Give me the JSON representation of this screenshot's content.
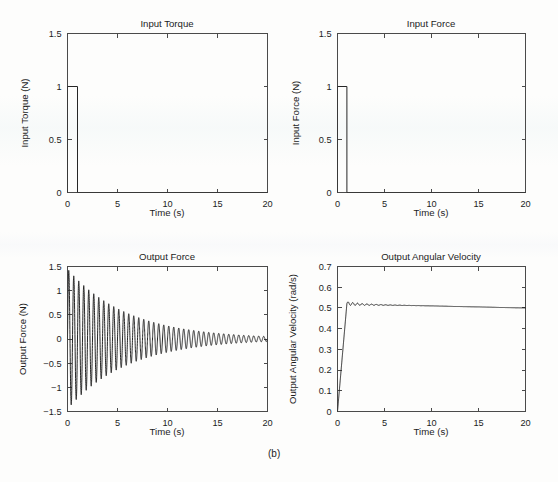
{
  "figure": {
    "subfigure_label": "(b)",
    "background_color": "#fdfdfc",
    "line_color": "#262626",
    "axis_color": "#4a4a4a"
  },
  "chart_data": [
    {
      "id": "input-torque",
      "type": "line",
      "title": "Input Torque",
      "xlabel": "Time (s)",
      "ylabel": "Input Torque (N)",
      "xlim": [
        0,
        20
      ],
      "ylim": [
        0,
        1.5
      ],
      "xticks": [
        0,
        5,
        10,
        15,
        20
      ],
      "xticklabels": [
        "0",
        "5",
        "10",
        "15",
        "20"
      ],
      "yticks": [
        0,
        0.5,
        1,
        1.5
      ],
      "yticklabels": [
        "0",
        "0.5",
        "1",
        "1.5"
      ],
      "grid": false,
      "legend": null,
      "series": [
        {
          "name": "Input Torque",
          "description": "Rectangular pulse of amplitude 1 N from t=0 s to t=1 s, zero afterwards",
          "x": [
            0,
            0,
            1,
            1,
            20
          ],
          "y": [
            0,
            1,
            1,
            0,
            0
          ]
        }
      ]
    },
    {
      "id": "input-force",
      "type": "line",
      "title": "Input Force",
      "xlabel": "Time (s)",
      "ylabel": "Input Force (N)",
      "xlim": [
        0,
        20
      ],
      "ylim": [
        0,
        1.5
      ],
      "xticks": [
        0,
        5,
        10,
        15,
        20
      ],
      "xticklabels": [
        "0",
        "5",
        "10",
        "15",
        "20"
      ],
      "yticks": [
        0,
        0.5,
        1,
        1.5
      ],
      "yticklabels": [
        "0",
        "0.5",
        "1",
        "1.5"
      ],
      "grid": false,
      "legend": null,
      "series": [
        {
          "name": "Input Force",
          "description": "Rectangular pulse of amplitude 1 N from t=0 s to t=1 s, zero afterwards",
          "x": [
            0,
            0,
            1,
            1,
            20
          ],
          "y": [
            0,
            1,
            1,
            0,
            0
          ]
        }
      ]
    },
    {
      "id": "output-force",
      "type": "line",
      "title": "Output Force",
      "xlabel": "Time (s)",
      "ylabel": "Output Force (N)",
      "xlim": [
        0,
        20
      ],
      "ylim": [
        -1.5,
        1.5
      ],
      "xticks": [
        0,
        5,
        10,
        15,
        20
      ],
      "xticklabels": [
        "0",
        "5",
        "10",
        "15",
        "20"
      ],
      "yticks": [
        -1.5,
        -1,
        -0.5,
        0,
        0.5,
        1,
        1.5
      ],
      "yticklabels": [
        "-1.5",
        "-1",
        "-0.5",
        "0",
        "0.5",
        "1",
        "1.5"
      ],
      "grid": false,
      "legend": null,
      "series": [
        {
          "name": "Output Force",
          "description": "Damped sinusoidal oscillation, initial peak about 1.45 N near t=0.1 s, most negative trough about -1.15 N near t=1.3 s, oscillation frequency about 2 Hz (period 0.5 s), envelope decaying exponentially to nearly 0 N by t=20 s",
          "model": {
            "form": "A*exp(-t/tau)*sin(2*pi*f*t + phi)",
            "amplitude_initial": 1.45,
            "frequency_hz": 2.0,
            "decay_tau_s": 6.0,
            "offset": 0.0,
            "envelope_at": [
              {
                "t": 0,
                "amp": 1.45
              },
              {
                "t": 2.5,
                "amp": 1.0
              },
              {
                "t": 5,
                "amp": 0.68
              },
              {
                "t": 7.5,
                "amp": 0.45
              },
              {
                "t": 10,
                "amp": 0.3
              },
              {
                "t": 12.5,
                "amp": 0.2
              },
              {
                "t": 15,
                "amp": 0.13
              },
              {
                "t": 17.5,
                "amp": 0.09
              },
              {
                "t": 20,
                "amp": 0.06
              }
            ]
          }
        }
      ]
    },
    {
      "id": "output-angular-velocity",
      "type": "line",
      "title": "Output Angular Velocity",
      "xlabel": "Time (s)",
      "ylabel": "Output Angular Velocity (rad/s)",
      "xlim": [
        0,
        20
      ],
      "ylim": [
        0,
        0.7
      ],
      "xticks": [
        0,
        5,
        10,
        15,
        20
      ],
      "xticklabels": [
        "0",
        "5",
        "10",
        "15",
        "20"
      ],
      "yticks": [
        0,
        0.1,
        0.2,
        0.3,
        0.4,
        0.5,
        0.6,
        0.7
      ],
      "yticklabels": [
        "0",
        "0.1",
        "0.2",
        "0.3",
        "0.4",
        "0.5",
        "0.6",
        "0.7"
      ],
      "grid": false,
      "legend": null,
      "series": [
        {
          "name": "Output Angular Velocity",
          "description": "Ramps linearly from 0 rad/s at t=0 to about 0.52 rad/s at t=1 s, small decaying ripple near 2 Hz from t=1 to about t=5 s, then slow linear decline to about 0.50 rad/s at t=20 s",
          "keypoints": [
            {
              "t": 0,
              "v": 0.0
            },
            {
              "t": 1.0,
              "v": 0.521
            },
            {
              "t": 2.0,
              "v": 0.518
            },
            {
              "t": 3.0,
              "v": 0.516
            },
            {
              "t": 5.0,
              "v": 0.514
            },
            {
              "t": 7.5,
              "v": 0.512
            },
            {
              "t": 10.0,
              "v": 0.51
            },
            {
              "t": 12.5,
              "v": 0.507
            },
            {
              "t": 15.0,
              "v": 0.505
            },
            {
              "t": 17.5,
              "v": 0.502
            },
            {
              "t": 20.0,
              "v": 0.5
            }
          ],
          "ripple": {
            "frequency_hz": 2.0,
            "amplitude_initial": 0.009,
            "decay_tau_s": 2.2,
            "start_t": 1.0
          }
        }
      ]
    }
  ]
}
